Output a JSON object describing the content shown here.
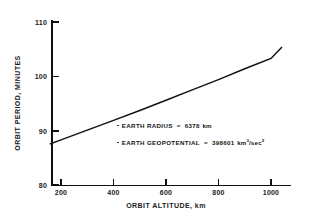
{
  "chart_data": {
    "type": "line",
    "title": "",
    "xlabel": "ORBIT ALTITUDE, km",
    "ylabel": "ORBIT PERIOD, MINUTES",
    "xlim": [
      160,
      1110
    ],
    "ylim": [
      80,
      110
    ],
    "xticks": [
      200,
      400,
      600,
      800,
      1000
    ],
    "xtick_labels": [
      "200",
      "400",
      "600",
      "800",
      "1000"
    ],
    "yticks": [
      80,
      90,
      100,
      110
    ],
    "ytick_labels": [
      "80",
      "90",
      "100",
      "110"
    ],
    "grid": false,
    "legend": "none",
    "series": [
      {
        "name": "Orbit period vs altitude",
        "x": [
          160,
          200,
          300,
          400,
          500,
          600,
          700,
          800,
          900,
          1000,
          1040
        ],
        "values": [
          87.6,
          88.3,
          90.1,
          91.9,
          93.7,
          95.6,
          97.5,
          99.4,
          101.4,
          103.3,
          105.3
        ]
      }
    ],
    "annotations": [
      {
        "bullet": "dot",
        "label": "EARTH RADIUS",
        "equals": "=",
        "value": "6378",
        "units": "km",
        "units_sup": ""
      },
      {
        "bullet": "dot",
        "label": "EARTH GEOPOTENTIAL",
        "equals": "=",
        "value": "398601",
        "units": "km",
        "units_sup": "3",
        "units_mid": "/sec",
        "units_sup2": "2"
      }
    ]
  },
  "figure": {
    "background_color": "#ffffff",
    "line_color": "#111111",
    "text_color": "#1a1a1a"
  }
}
